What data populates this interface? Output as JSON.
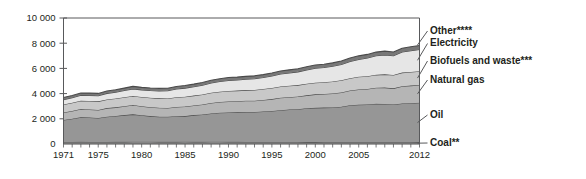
{
  "chart_data": {
    "type": "area",
    "stacked": true,
    "title": "",
    "subtitle": "",
    "xlabel": "",
    "ylabel": "",
    "xlim": [
      1971,
      2012
    ],
    "ylim": [
      0,
      10000
    ],
    "grid": false,
    "legend_position": "right-inline",
    "x_tick_labels": [
      "1971",
      "1975",
      "1980",
      "1985",
      "1990",
      "1995",
      "2000",
      "2005",
      "2012"
    ],
    "x_tick_values": [
      1971,
      1975,
      1980,
      1985,
      1990,
      1995,
      2000,
      2005,
      2012
    ],
    "y_tick_labels": [
      "0",
      "2 000",
      "4 000",
      "6 000",
      "8 000",
      "10 000"
    ],
    "y_tick_values": [
      0,
      2000,
      4000,
      6000,
      8000,
      10000
    ],
    "x": [
      1971,
      1972,
      1973,
      1974,
      1975,
      1976,
      1977,
      1978,
      1979,
      1980,
      1981,
      1982,
      1983,
      1984,
      1985,
      1986,
      1987,
      1988,
      1989,
      1990,
      1991,
      1992,
      1993,
      1994,
      1995,
      1996,
      1997,
      1998,
      1999,
      2000,
      2001,
      2002,
      2003,
      2004,
      2005,
      2006,
      2007,
      2008,
      2009,
      2010,
      2011,
      2012
    ],
    "series": [
      {
        "name": "Coal**",
        "label": "Coal**",
        "color": "#9a9a9a",
        "values": [
          165,
          168,
          170,
          168,
          165,
          168,
          170,
          172,
          175,
          178,
          175,
          172,
          170,
          172,
          175,
          172,
          172,
          175,
          175,
          172,
          170,
          168,
          165,
          162,
          162,
          160,
          158,
          155,
          152,
          150,
          148,
          145,
          145,
          142,
          142,
          140,
          140,
          138,
          135,
          135,
          133,
          132
        ]
      },
      {
        "name": "Oil",
        "label": "Oil",
        "color": "#969696",
        "values": [
          1740,
          1840,
          1960,
          1930,
          1900,
          2000,
          2050,
          2120,
          2180,
          2100,
          2040,
          2000,
          1990,
          2030,
          2040,
          2120,
          2170,
          2250,
          2300,
          2330,
          2340,
          2370,
          2370,
          2420,
          2460,
          2520,
          2580,
          2610,
          2680,
          2720,
          2740,
          2760,
          2810,
          2930,
          2980,
          3000,
          3050,
          3040,
          3000,
          3080,
          3110,
          3140
        ]
      },
      {
        "name": "Natural gas",
        "label": "Natural gas",
        "color": "#b5b5b5",
        "values": [
          590,
          620,
          650,
          650,
          640,
          680,
          690,
          710,
          740,
          720,
          710,
          700,
          700,
          740,
          760,
          760,
          790,
          830,
          860,
          880,
          890,
          890,
          900,
          910,
          940,
          990,
          980,
          1000,
          1030,
          1070,
          1080,
          1110,
          1140,
          1170,
          1210,
          1230,
          1270,
          1300,
          1280,
          1370,
          1390,
          1410
        ]
      },
      {
        "name": "Biofuels and waste***",
        "label": "Biofuels and waste***",
        "color": "#c8c8c8",
        "values": [
          640,
          650,
          660,
          670,
          680,
          690,
          700,
          710,
          720,
          730,
          740,
          750,
          760,
          770,
          780,
          790,
          800,
          810,
          820,
          830,
          840,
          850,
          860,
          870,
          880,
          890,
          900,
          910,
          920,
          930,
          940,
          950,
          960,
          980,
          1000,
          1010,
          1030,
          1050,
          1060,
          1080,
          1090,
          1100
        ]
      },
      {
        "name": "Electricity",
        "label": "Electricity",
        "color": "#e6e6e6",
        "values": [
          380,
          400,
          430,
          440,
          450,
          480,
          500,
          530,
          560,
          570,
          580,
          590,
          610,
          650,
          680,
          700,
          730,
          770,
          800,
          830,
          840,
          860,
          880,
          910,
          950,
          990,
          1020,
          1050,
          1090,
          1140,
          1160,
          1210,
          1260,
          1330,
          1380,
          1440,
          1510,
          1540,
          1530,
          1630,
          1680,
          1720
        ]
      },
      {
        "name": "Other****",
        "label": "Other****",
        "color": "#787878",
        "values": [
          170,
          175,
          180,
          180,
          180,
          185,
          190,
          195,
          200,
          200,
          200,
          200,
          200,
          205,
          210,
          210,
          215,
          220,
          225,
          230,
          230,
          230,
          235,
          235,
          240,
          245,
          245,
          250,
          255,
          260,
          260,
          265,
          270,
          280,
          285,
          290,
          295,
          300,
          295,
          305,
          310,
          315
        ]
      }
    ],
    "legend_entries": [
      {
        "label": "Other****",
        "color": "#787878"
      },
      {
        "label": "Electricity",
        "color": "#e6e6e6"
      },
      {
        "label": "Biofuels and waste***",
        "color": "#c8c8c8"
      },
      {
        "label": "Natural gas",
        "color": "#b5b5b5"
      },
      {
        "label": "Oil",
        "color": "#969696"
      },
      {
        "label": "Coal**",
        "color": "#9a9a9a"
      }
    ]
  }
}
